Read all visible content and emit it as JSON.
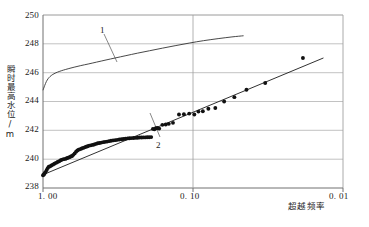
{
  "chart_data": {
    "type": "scatter",
    "title": "",
    "xlabel": "超越频率",
    "ylabel": "瞬时最高水位/m",
    "xlim": [
      1.0,
      0.01
    ],
    "ylim": [
      238,
      250
    ],
    "xscale": "log-reversed",
    "grid": true,
    "legend_position": "inline-annotations",
    "x_ticks": [
      "1. 00",
      "0. 10",
      "0. 01"
    ],
    "x_tick_values": [
      1.0,
      0.1,
      0.01
    ],
    "y_ticks": [
      "238",
      "240",
      "242",
      "244",
      "246",
      "248",
      "250"
    ],
    "y_tick_values": [
      238,
      240,
      242,
      244,
      246,
      248,
      250
    ],
    "annotations": [
      {
        "text": "1",
        "x": 0.62,
        "y": 249.0,
        "describes": "upper-smooth-curve"
      },
      {
        "text": "2",
        "x": 0.215,
        "y": 240.65,
        "describes": "fitted-straight-line"
      }
    ],
    "series": [
      {
        "name": "1",
        "type": "line",
        "style": "smooth-curve",
        "color": "#333333",
        "points": [
          [
            1.0,
            244.78
          ],
          [
            0.975,
            245.1
          ],
          [
            0.95,
            245.38
          ],
          [
            0.925,
            245.58
          ],
          [
            0.9,
            245.72
          ],
          [
            0.86,
            245.88
          ],
          [
            0.82,
            245.99
          ],
          [
            0.78,
            246.08
          ],
          [
            0.73,
            246.18
          ],
          [
            0.68,
            246.27
          ],
          [
            0.62,
            246.38
          ],
          [
            0.56,
            246.49
          ],
          [
            0.5,
            246.6
          ],
          [
            0.44,
            246.73
          ],
          [
            0.38,
            246.88
          ],
          [
            0.33,
            247.02
          ],
          [
            0.28,
            247.18
          ],
          [
            0.235,
            247.35
          ],
          [
            0.195,
            247.52
          ],
          [
            0.16,
            247.7
          ],
          [
            0.13,
            247.88
          ],
          [
            0.105,
            248.06
          ],
          [
            0.085,
            248.22
          ],
          [
            0.068,
            248.36
          ],
          [
            0.055,
            248.48
          ],
          [
            0.046,
            248.56
          ]
        ]
      },
      {
        "name": "2",
        "type": "line",
        "style": "straight-fit-line",
        "color": "#1a1a1a",
        "points": [
          [
            1.0,
            238.92
          ],
          [
            0.0135,
            247.02
          ]
        ]
      },
      {
        "name": "observed-data",
        "type": "scatter",
        "marker": "filled-circle",
        "color": "#111111",
        "points": [
          [
            1.0,
            238.88
          ],
          [
            0.985,
            238.94
          ],
          [
            0.975,
            239.02
          ],
          [
            0.96,
            239.12
          ],
          [
            0.945,
            239.25
          ],
          [
            0.93,
            239.38
          ],
          [
            0.915,
            239.48
          ],
          [
            0.9,
            239.5
          ],
          [
            0.88,
            239.56
          ],
          [
            0.86,
            239.62
          ],
          [
            0.84,
            239.68
          ],
          [
            0.82,
            239.74
          ],
          [
            0.8,
            239.8
          ],
          [
            0.78,
            239.86
          ],
          [
            0.762,
            239.92
          ],
          [
            0.745,
            239.97
          ],
          [
            0.728,
            240.0
          ],
          [
            0.71,
            240.02
          ],
          [
            0.695,
            240.06
          ],
          [
            0.68,
            240.1
          ],
          [
            0.666,
            240.14
          ],
          [
            0.652,
            240.18
          ],
          [
            0.64,
            240.22
          ],
          [
            0.628,
            240.3
          ],
          [
            0.615,
            240.4
          ],
          [
            0.602,
            240.52
          ],
          [
            0.59,
            240.6
          ],
          [
            0.578,
            240.66
          ],
          [
            0.565,
            240.7
          ],
          [
            0.552,
            240.74
          ],
          [
            0.54,
            240.78
          ],
          [
            0.528,
            240.82
          ],
          [
            0.516,
            240.86
          ],
          [
            0.504,
            240.9
          ],
          [
            0.492,
            240.94
          ],
          [
            0.48,
            240.96
          ],
          [
            0.468,
            240.99
          ],
          [
            0.456,
            241.02
          ],
          [
            0.444,
            241.06
          ],
          [
            0.432,
            241.1
          ],
          [
            0.42,
            241.12
          ],
          [
            0.408,
            241.15
          ],
          [
            0.396,
            241.18
          ],
          [
            0.385,
            241.2
          ],
          [
            0.374,
            241.22
          ],
          [
            0.363,
            241.25
          ],
          [
            0.352,
            241.28
          ],
          [
            0.341,
            241.3
          ],
          [
            0.33,
            241.32
          ],
          [
            0.32,
            241.34
          ],
          [
            0.31,
            241.36
          ],
          [
            0.3,
            241.38
          ],
          [
            0.291,
            241.4
          ],
          [
            0.282,
            241.42
          ],
          [
            0.273,
            241.44
          ],
          [
            0.265,
            241.45
          ],
          [
            0.257,
            241.46
          ],
          [
            0.249,
            241.47
          ],
          [
            0.241,
            241.48
          ],
          [
            0.234,
            241.49
          ],
          [
            0.227,
            241.5
          ],
          [
            0.22,
            241.5
          ],
          [
            0.214,
            241.51
          ],
          [
            0.208,
            241.51
          ],
          [
            0.202,
            241.52
          ],
          [
            0.196,
            241.52
          ],
          [
            0.19,
            241.53
          ],
          [
            0.185,
            242.1
          ],
          [
            0.181,
            242.08
          ],
          [
            0.177,
            242.14
          ],
          [
            0.173,
            242.16
          ],
          [
            0.168,
            242.12
          ],
          [
            0.16,
            242.38
          ],
          [
            0.152,
            242.4
          ],
          [
            0.145,
            242.45
          ],
          [
            0.136,
            242.52
          ],
          [
            0.124,
            243.1
          ],
          [
            0.115,
            243.12
          ],
          [
            0.106,
            243.16
          ],
          [
            0.098,
            243.1
          ],
          [
            0.092,
            243.3
          ],
          [
            0.086,
            243.32
          ],
          [
            0.079,
            243.5
          ],
          [
            0.071,
            243.55
          ],
          [
            0.062,
            244.0
          ],
          [
            0.053,
            244.3
          ],
          [
            0.044,
            244.82
          ],
          [
            0.033,
            245.28
          ],
          [
            0.0185,
            247.02
          ]
        ]
      }
    ]
  },
  "axes": {
    "y_axis_title": "瞬时最高水位/m",
    "x_axis_title": "超越频率"
  }
}
